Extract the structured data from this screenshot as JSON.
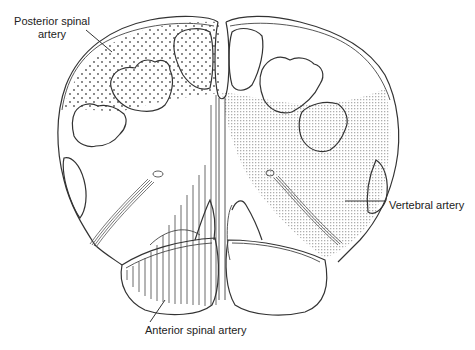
{
  "diagram": {
    "labels": {
      "posterior_spinal_artery": "Posterior spinal\nartery",
      "posterior_spinal_artery_line1": "Posterior spinal",
      "posterior_spinal_artery_line2": "artery",
      "vertebral_artery": "Vertebral artery",
      "anterior_spinal_artery": "Anterior spinal artery"
    },
    "territories": [
      {
        "name": "Posterior spinal artery",
        "pattern": "coarse dots",
        "side": "left dorsal"
      },
      {
        "name": "Vertebral artery",
        "pattern": "fine stipple",
        "side": "right lateral"
      },
      {
        "name": "Anterior spinal artery",
        "pattern": "vertical lines",
        "side": "left ventral/medial"
      }
    ],
    "colors": {
      "line": "#333333",
      "stipple": "#bdbdbd",
      "background": "#ffffff"
    }
  }
}
